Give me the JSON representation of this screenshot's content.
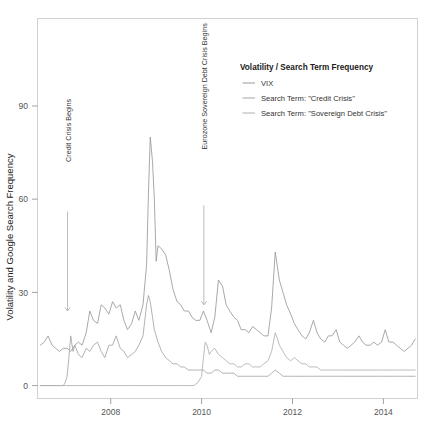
{
  "chart_data": {
    "type": "line",
    "title": "",
    "xlabel": "",
    "ylabel": "Volatility and Google Search Frequency",
    "xlim": [
      2006.4,
      2014.75
    ],
    "ylim": [
      -4,
      118
    ],
    "xticks": [
      "2008",
      "2010",
      "2012",
      "2014"
    ],
    "xtick_values": [
      2008,
      2010,
      2012,
      2014
    ],
    "yticks": [
      "0",
      "30",
      "60",
      "90"
    ],
    "ytick_values": [
      0,
      30,
      60,
      90
    ],
    "grid": false,
    "legend_position": "top-right",
    "legend_title": "Volatility / Search Term Frequency",
    "series": [
      {
        "name": "VIX",
        "color": "#9a9a9a",
        "x": [
          2006.45,
          2006.54,
          2006.62,
          2006.71,
          2006.79,
          2006.87,
          2006.96,
          2007.04,
          2007.12,
          2007.21,
          2007.29,
          2007.37,
          2007.46,
          2007.54,
          2007.62,
          2007.71,
          2007.79,
          2007.87,
          2007.96,
          2008.04,
          2008.12,
          2008.21,
          2008.29,
          2008.37,
          2008.46,
          2008.54,
          2008.62,
          2008.71,
          2008.79,
          2008.83,
          2008.87,
          2008.92,
          2008.96,
          2009.0,
          2009.04,
          2009.12,
          2009.21,
          2009.29,
          2009.37,
          2009.46,
          2009.54,
          2009.62,
          2009.71,
          2009.79,
          2009.87,
          2009.96,
          2010.04,
          2010.12,
          2010.21,
          2010.29,
          2010.37,
          2010.46,
          2010.54,
          2010.62,
          2010.71,
          2010.79,
          2010.87,
          2010.96,
          2011.04,
          2011.12,
          2011.21,
          2011.29,
          2011.37,
          2011.46,
          2011.54,
          2011.62,
          2011.67,
          2011.71,
          2011.79,
          2011.87,
          2011.96,
          2012.04,
          2012.12,
          2012.21,
          2012.29,
          2012.37,
          2012.46,
          2012.54,
          2012.62,
          2012.71,
          2012.79,
          2012.87,
          2012.96,
          2013.04,
          2013.12,
          2013.21,
          2013.29,
          2013.37,
          2013.46,
          2013.54,
          2013.62,
          2013.71,
          2013.79,
          2013.87,
          2013.96,
          2014.04,
          2014.12,
          2014.21,
          2014.29,
          2014.37,
          2014.46,
          2014.54,
          2014.62,
          2014.7
        ],
        "values": [
          13,
          14,
          16,
          13,
          12,
          11,
          12,
          12,
          11,
          13,
          14,
          13,
          17,
          24,
          21,
          20,
          26,
          25,
          23,
          27,
          25,
          26,
          21,
          18,
          20,
          24,
          21,
          26,
          39,
          62,
          80,
          72,
          60,
          40,
          45,
          44,
          42,
          37,
          31,
          27,
          26,
          24,
          24,
          22,
          21,
          21,
          24,
          21,
          17,
          22,
          34,
          32,
          26,
          24,
          22,
          21,
          18,
          18,
          17,
          19,
          18,
          17,
          16,
          16,
          25,
          43,
          38,
          34,
          30,
          26,
          23,
          20,
          18,
          16,
          15,
          17,
          21,
          17,
          15,
          14,
          16,
          16,
          18,
          14,
          13,
          12,
          13,
          14,
          16,
          14,
          13,
          13,
          14,
          13,
          14,
          18,
          14,
          14,
          13,
          12,
          11,
          12,
          13,
          15
        ]
      },
      {
        "name": "Search Term: \"Credit Crisis\"",
        "color": "#a5a5a5",
        "x": [
          2006.45,
          2006.54,
          2006.62,
          2006.71,
          2006.79,
          2006.87,
          2006.96,
          2007.0,
          2007.04,
          2007.08,
          2007.12,
          2007.17,
          2007.21,
          2007.29,
          2007.37,
          2007.46,
          2007.54,
          2007.62,
          2007.71,
          2007.79,
          2007.87,
          2007.96,
          2008.04,
          2008.12,
          2008.21,
          2008.29,
          2008.37,
          2008.46,
          2008.54,
          2008.62,
          2008.71,
          2008.79,
          2008.83,
          2008.87,
          2008.92,
          2008.96,
          2009.04,
          2009.12,
          2009.21,
          2009.29,
          2009.37,
          2009.46,
          2009.54,
          2009.62,
          2009.71,
          2009.79,
          2009.87,
          2009.96,
          2010.04,
          2010.12,
          2010.21,
          2010.29,
          2010.37,
          2010.46,
          2010.54,
          2010.62,
          2010.71,
          2010.79,
          2010.87,
          2010.96,
          2011.04,
          2011.12,
          2011.21,
          2011.29,
          2011.37,
          2011.46,
          2011.54,
          2011.62,
          2011.71,
          2011.79,
          2011.87,
          2011.96,
          2012.12,
          2012.29,
          2012.46,
          2012.62,
          2012.79,
          2012.96,
          2013.12,
          2013.29,
          2013.46,
          2013.62,
          2013.79,
          2013.96,
          2014.12,
          2014.29,
          2014.46,
          2014.7
        ],
        "values": [
          0,
          0,
          0,
          0,
          0,
          0,
          0,
          1,
          3,
          9,
          16,
          11,
          13,
          10,
          9,
          12,
          11,
          13,
          14,
          11,
          9,
          13,
          13,
          16,
          12,
          11,
          9,
          10,
          11,
          13,
          16,
          26,
          29,
          27,
          22,
          18,
          14,
          11,
          9,
          8,
          7,
          7,
          6,
          6,
          5,
          5,
          5,
          5,
          5,
          4,
          4,
          5,
          5,
          4,
          4,
          4,
          4,
          3,
          3,
          3,
          3,
          3,
          3,
          3,
          3,
          3,
          4,
          5,
          4,
          3,
          3,
          3,
          3,
          3,
          3,
          3,
          3,
          3,
          3,
          3,
          3,
          3,
          3,
          3,
          3,
          3,
          3,
          3
        ]
      },
      {
        "name": "Search Term: \"Sovereign Debt Crisis\"",
        "color": "#b0b0b0",
        "x": [
          2006.45,
          2007.0,
          2007.5,
          2008.0,
          2008.5,
          2009.0,
          2009.5,
          2009.83,
          2009.92,
          2010.0,
          2010.04,
          2010.08,
          2010.12,
          2010.17,
          2010.21,
          2010.29,
          2010.37,
          2010.46,
          2010.54,
          2010.62,
          2010.71,
          2010.79,
          2010.87,
          2010.96,
          2011.04,
          2011.12,
          2011.21,
          2011.29,
          2011.37,
          2011.46,
          2011.54,
          2011.62,
          2011.67,
          2011.71,
          2011.79,
          2011.87,
          2011.96,
          2012.04,
          2012.12,
          2012.21,
          2012.29,
          2012.37,
          2012.46,
          2012.54,
          2012.62,
          2012.71,
          2012.79,
          2012.87,
          2012.96,
          2013.12,
          2013.29,
          2013.46,
          2013.62,
          2013.79,
          2013.96,
          2014.12,
          2014.29,
          2014.46,
          2014.7
        ],
        "values": [
          0,
          0,
          0,
          0,
          0,
          0,
          0,
          0,
          1,
          3,
          9,
          14,
          13,
          10,
          11,
          12,
          10,
          9,
          8,
          7,
          7,
          6,
          6,
          7,
          7,
          6,
          6,
          6,
          7,
          8,
          11,
          17,
          15,
          13,
          11,
          9,
          8,
          9,
          8,
          7,
          7,
          6,
          6,
          6,
          5,
          5,
          5,
          5,
          5,
          5,
          5,
          5,
          5,
          5,
          5,
          5,
          5,
          5,
          5
        ]
      }
    ],
    "annotations": [
      {
        "name": "credit-crisis-annotation",
        "label": "Credit Crisis Begins",
        "x": 2007.05,
        "text_y": 72,
        "arrow_from_y": 56,
        "arrow_to_y": 24
      },
      {
        "name": "eurozone-crisis-annotation",
        "label": "Eurozone Sovereign Debt Crisis Begins",
        "x": 2010.05,
        "text_y": 76,
        "arrow_from_y": 58,
        "arrow_to_y": 26
      }
    ]
  },
  "legend": {
    "title": "Volatility / Search Term Frequency",
    "items": [
      {
        "label": "VIX",
        "color": "#9a9a9a"
      },
      {
        "label": "Search Term: \"Credit Crisis\"",
        "color": "#a5a5a5"
      },
      {
        "label": "Search Term: \"Sovereign Debt Crisis\"",
        "color": "#b0b0b0"
      }
    ]
  }
}
